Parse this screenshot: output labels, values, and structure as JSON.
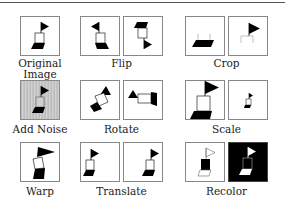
{
  "figure": {
    "groups": [
      {
        "id": "original",
        "label_line1": "Original",
        "label_line2": "Image",
        "panels": 1
      },
      {
        "id": "flip",
        "label": "Flip",
        "panels": 2
      },
      {
        "id": "crop",
        "label": "Crop",
        "panels": 2
      },
      {
        "id": "add-noise",
        "label": "Add Noise",
        "panels": 1
      },
      {
        "id": "rotate",
        "label": "Rotate",
        "panels": 2
      },
      {
        "id": "scale",
        "label": "Scale",
        "panels": 2
      },
      {
        "id": "warp",
        "label": "Warp",
        "panels": 1
      },
      {
        "id": "translate",
        "label": "Translate",
        "panels": 2
      },
      {
        "id": "recolor",
        "label": "Recolor",
        "panels": 2
      }
    ],
    "colors": {
      "ink": "#000000",
      "panel_border": "#888888",
      "noise_bg": "#c8c8c8",
      "recolor_dark_bg": "#000000"
    }
  }
}
